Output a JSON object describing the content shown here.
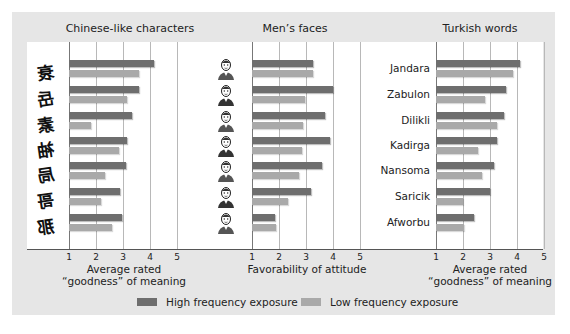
{
  "chart_data": [
    {
      "type": "bar",
      "orientation": "horizontal",
      "title": "Chinese-like characters",
      "categories": [
        "char-1",
        "char-2",
        "char-3",
        "char-4",
        "char-5",
        "char-6",
        "char-7"
      ],
      "series": [
        {
          "name": "High frequency exposure",
          "values": [
            4.15,
            3.6,
            3.35,
            3.15,
            3.1,
            2.9,
            2.95
          ]
        },
        {
          "name": "Low frequency exposure",
          "values": [
            3.6,
            3.15,
            1.8,
            2.85,
            2.35,
            2.2,
            2.6
          ]
        }
      ],
      "xlabel": "Average rated “goodness” of meaning",
      "xlim": [
        1,
        5
      ],
      "xticks": [
        1,
        2,
        3,
        4,
        5
      ],
      "grid": true
    },
    {
      "type": "bar",
      "orientation": "horizontal",
      "title": "Men’s faces",
      "categories": [
        "face-1",
        "face-2",
        "face-3",
        "face-4",
        "face-5",
        "face-6",
        "face-7"
      ],
      "series": [
        {
          "name": "High frequency exposure",
          "values": [
            3.25,
            4.0,
            3.7,
            3.9,
            3.6,
            3.2,
            1.85
          ]
        },
        {
          "name": "Low frequency exposure",
          "values": [
            3.25,
            2.95,
            2.9,
            2.85,
            2.75,
            2.35,
            1.9
          ]
        }
      ],
      "xlabel": "Favorability of attitude",
      "xlim": [
        1,
        5
      ],
      "xticks": [
        1,
        2,
        3,
        4,
        5
      ],
      "grid": true
    },
    {
      "type": "bar",
      "orientation": "horizontal",
      "title": "Turkish words",
      "categories": [
        "Jandara",
        "Zabulon",
        "Dilikli",
        "Kadirga",
        "Nansoma",
        "Saricik",
        "Afworbu"
      ],
      "series": [
        {
          "name": "High frequency exposure",
          "values": [
            4.1,
            3.6,
            3.5,
            3.25,
            3.15,
            3.0,
            2.4
          ]
        },
        {
          "name": "Low frequency exposure",
          "values": [
            3.85,
            2.8,
            3.25,
            2.55,
            2.7,
            2.0,
            2.05
          ]
        }
      ],
      "xlabel": "Average rated “goodness” of meaning",
      "xlim": [
        1,
        5
      ],
      "xticks": [
        1,
        2,
        3,
        4,
        5
      ],
      "grid": true
    }
  ],
  "panels": [
    {
      "title": "Chinese-like characters",
      "xlabel_line1": "Average rated",
      "xlabel_line2": "“goodness” of meaning",
      "row_glyphs": [
        "衰",
        "岳",
        "素",
        "袖",
        "局",
        "哥",
        "那"
      ]
    },
    {
      "title": "Men’s faces",
      "xlabel_line1": "Favorability of attitude",
      "xlabel_line2": ""
    },
    {
      "title": "Turkish words",
      "xlabel_line1": "Average rated",
      "xlabel_line2": "“goodness” of meaning",
      "row_labels": [
        "Jandara",
        "Zabulon",
        "Dilikli",
        "Kadirga",
        "Nansoma",
        "Saricik",
        "Afworbu"
      ]
    }
  ],
  "ticks": [
    "1",
    "2",
    "3",
    "4",
    "5"
  ],
  "legend": {
    "high": {
      "label": "High frequency exposure",
      "color": "#6e6e6e"
    },
    "low": {
      "label": "Low frequency exposure",
      "color": "#a9a9a9"
    }
  }
}
